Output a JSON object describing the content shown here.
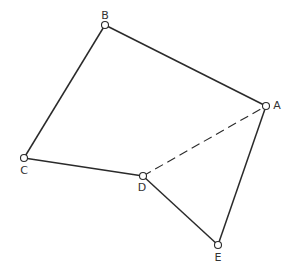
{
  "diagram": {
    "type": "graph",
    "colors": {
      "edge": "#2a2a2a",
      "node_stroke": "#2a2a2a",
      "node_fill": "#ffffff",
      "label": "#333333"
    },
    "nodes": [
      {
        "id": "A",
        "label": "A",
        "x": 266,
        "y": 106,
        "lx": 277,
        "ly": 109
      },
      {
        "id": "B",
        "label": "B",
        "x": 105,
        "y": 25,
        "lx": 105,
        "ly": 19
      },
      {
        "id": "C",
        "label": "C",
        "x": 24,
        "y": 158,
        "lx": 24,
        "ly": 174
      },
      {
        "id": "D",
        "label": "D",
        "x": 143,
        "y": 176,
        "lx": 142,
        "ly": 191
      },
      {
        "id": "E",
        "label": "E",
        "x": 218,
        "y": 245,
        "lx": 218,
        "ly": 261
      }
    ],
    "edges": [
      {
        "from": "B",
        "to": "A",
        "style": "solid"
      },
      {
        "from": "B",
        "to": "C",
        "style": "solid"
      },
      {
        "from": "C",
        "to": "D",
        "style": "solid"
      },
      {
        "from": "D",
        "to": "E",
        "style": "solid"
      },
      {
        "from": "A",
        "to": "E",
        "style": "solid"
      },
      {
        "from": "D",
        "to": "A",
        "style": "dashed"
      }
    ]
  }
}
